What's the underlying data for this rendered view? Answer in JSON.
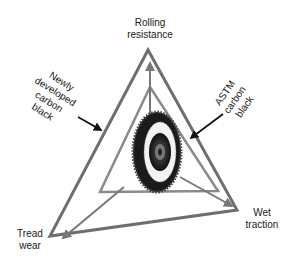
{
  "diagram": {
    "type": "performance triangle",
    "corners": {
      "top": "Rolling resistance",
      "top_line1": "Rolling",
      "top_line2": "resistance",
      "bottom_left_line1": "Tread",
      "bottom_left_line2": "wear",
      "bottom_right_line1": "Wet",
      "bottom_right_line2": "traction"
    },
    "callouts": {
      "outer": {
        "line1": "Newly",
        "line2": "developed",
        "line3": "carbon",
        "line4": "black"
      },
      "inner": {
        "line1": "ASTM",
        "line2": "carbon",
        "line3": "black"
      }
    },
    "colors": {
      "outer_triangle": "#6e6e6e",
      "inner_triangle": "#8a8a8a",
      "arrows": "#777777",
      "callout_arrows": "#111111",
      "text": "#1a1a1a"
    },
    "center_image": "tire-icon"
  }
}
